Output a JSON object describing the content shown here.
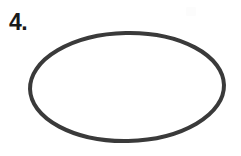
{
  "worksheet": {
    "item_label": "4.",
    "background_color": "#ffffff"
  },
  "figure": {
    "shape_name": "ellipse",
    "stroke_color": "#3a3a3a",
    "fill_color": "none",
    "stroke_width": 4,
    "center_x": 127,
    "center_y": 87,
    "radius_x": 97,
    "radius_y": 54,
    "rotation_deg": -1.2,
    "bounds": {
      "left": 30,
      "top": 33,
      "right": 225,
      "bottom": 141,
      "width": 195,
      "height": 108
    }
  },
  "canvas": {
    "width": 241,
    "height": 156
  }
}
